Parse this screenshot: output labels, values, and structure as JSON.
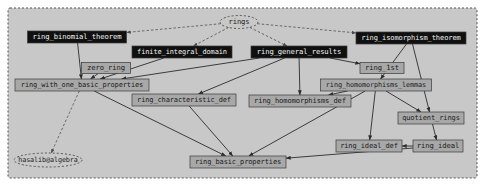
{
  "graph": {
    "title": "rings",
    "cluster_label": "",
    "colors": {
      "background": "#ffffff",
      "cluster_fill": "#c8c8c8",
      "cluster_stroke": "#555555",
      "node_dark_fill": "#101010",
      "node_light_fill": "#a8a8a8",
      "node_ellipse_fill": "#c8c8c8",
      "edge": "#2b2b2b",
      "label_on_dark": "#f2f2f2",
      "label_on_light": "#1b1b1b"
    },
    "nodes": [
      {
        "id": "rings",
        "label": "rings",
        "shape": "ellipse",
        "style": "dashed",
        "x": 239,
        "y": 22,
        "w": 38,
        "h": 13
      },
      {
        "id": "ring_binomial_theorem",
        "label": "ring_binomial_theorem",
        "shape": "box",
        "style": "dark",
        "x": 77,
        "y": 37,
        "w": 99,
        "h": 12
      },
      {
        "id": "finite_integral_domain",
        "label": "finite_integral_domain",
        "shape": "box",
        "style": "dark",
        "x": 182,
        "y": 52,
        "w": 100,
        "h": 12
      },
      {
        "id": "ring_general_results",
        "label": "ring_general_results",
        "shape": "box",
        "style": "dark",
        "x": 299,
        "y": 52,
        "w": 96,
        "h": 12
      },
      {
        "id": "ring_isomorphism_theorem",
        "label": "ring_isomorphism_theorem",
        "shape": "box",
        "style": "dark",
        "x": 411,
        "y": 38,
        "w": 110,
        "h": 12
      },
      {
        "id": "zero_ring",
        "label": "zero_ring",
        "shape": "box",
        "style": "light",
        "x": 106,
        "y": 68,
        "w": 49,
        "h": 11
      },
      {
        "id": "ring_1st",
        "label": "ring_1st",
        "shape": "box",
        "style": "light",
        "x": 382,
        "y": 68,
        "w": 44,
        "h": 11
      },
      {
        "id": "ring_with_one_basic_properties",
        "label": "ring_with_one_basic_properties",
        "shape": "box",
        "style": "light",
        "x": 82,
        "y": 85,
        "w": 134,
        "h": 12
      },
      {
        "id": "ring_homomorphisms_lemmas",
        "label": "ring_homomorphisms_lemmas",
        "shape": "box",
        "style": "light",
        "x": 376,
        "y": 85,
        "w": 111,
        "h": 12
      },
      {
        "id": "ring_characteristic_def",
        "label": "ring_characteristic_def",
        "shape": "box",
        "style": "light",
        "x": 184,
        "y": 100,
        "w": 104,
        "h": 12
      },
      {
        "id": "ring_homomorphisms_def",
        "label": "ring_homomorphisms_def",
        "shape": "box",
        "style": "light",
        "x": 300,
        "y": 101,
        "w": 102,
        "h": 12
      },
      {
        "id": "quotient_rings",
        "label": "quotient_rings",
        "shape": "box",
        "style": "light",
        "x": 431,
        "y": 118,
        "w": 66,
        "h": 12
      },
      {
        "id": "ring_ideal_def",
        "label": "ring_ideal_def",
        "shape": "box",
        "style": "light",
        "x": 369,
        "y": 146,
        "w": 66,
        "h": 12
      },
      {
        "id": "ring_ideal",
        "label": "ring_ideal",
        "shape": "box",
        "style": "light",
        "x": 438,
        "y": 146,
        "w": 50,
        "h": 12
      },
      {
        "id": "ring_basic_properties",
        "label": "ring_basic_properties",
        "shape": "box",
        "style": "light",
        "x": 238,
        "y": 162,
        "w": 96,
        "h": 12
      },
      {
        "id": "hasalib_algebra",
        "label": "hasalib@algebra",
        "shape": "ellipse",
        "style": "dashed",
        "x": 48,
        "y": 160,
        "w": 68,
        "h": 14
      }
    ],
    "edges": [
      {
        "from": "rings",
        "to": "ring_binomial_theorem",
        "style": "dashed"
      },
      {
        "from": "rings",
        "to": "finite_integral_domain",
        "style": "dashed"
      },
      {
        "from": "rings",
        "to": "ring_general_results",
        "style": "dashed"
      },
      {
        "from": "rings",
        "to": "ring_isomorphism_theorem",
        "style": "dashed"
      },
      {
        "from": "ring_binomial_theorem",
        "to": "ring_with_one_basic_properties",
        "style": "solid"
      },
      {
        "from": "finite_integral_domain",
        "to": "ring_with_one_basic_properties",
        "style": "solid"
      },
      {
        "from": "zero_ring",
        "to": "ring_with_one_basic_properties",
        "style": "solid"
      },
      {
        "from": "ring_general_results",
        "to": "ring_with_one_basic_properties",
        "style": "solid"
      },
      {
        "from": "ring_general_results",
        "to": "ring_1st",
        "style": "solid"
      },
      {
        "from": "ring_general_results",
        "to": "ring_characteristic_def",
        "style": "solid"
      },
      {
        "from": "ring_general_results",
        "to": "ring_homomorphisms_def",
        "style": "solid"
      },
      {
        "from": "ring_isomorphism_theorem",
        "to": "ring_homomorphisms_lemmas",
        "style": "solid"
      },
      {
        "from": "ring_isomorphism_theorem",
        "to": "quotient_rings",
        "style": "solid"
      },
      {
        "from": "ring_homomorphisms_lemmas",
        "to": "ring_homomorphisms_def",
        "style": "solid"
      },
      {
        "from": "ring_homomorphisms_lemmas",
        "to": "quotient_rings",
        "style": "solid"
      },
      {
        "from": "ring_homomorphisms_lemmas",
        "to": "ring_ideal_def",
        "style": "solid"
      },
      {
        "from": "ring_homomorphisms_lemmas",
        "to": "ring_basic_properties",
        "style": "solid"
      },
      {
        "from": "quotient_rings",
        "to": "ring_ideal",
        "style": "solid"
      },
      {
        "from": "ring_ideal",
        "to": "ring_ideal_def",
        "style": "solid"
      },
      {
        "from": "ring_ideal",
        "to": "ring_basic_properties",
        "style": "solid"
      },
      {
        "from": "ring_characteristic_def",
        "to": "ring_basic_properties",
        "style": "solid"
      },
      {
        "from": "ring_with_one_basic_properties",
        "to": "ring_basic_properties",
        "style": "solid"
      },
      {
        "from": "ring_with_one_basic_properties",
        "to": "hasalib_algebra",
        "style": "dashed"
      }
    ]
  }
}
